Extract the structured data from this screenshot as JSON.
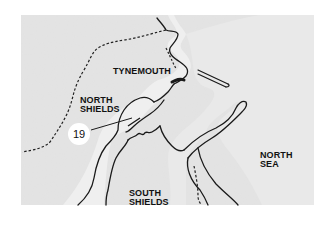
{
  "map": {
    "colors": {
      "land": "#e6e6e6",
      "water": "#f3f3f3",
      "coastline": "#1a1a1a",
      "background": "#ffffff"
    },
    "labels": {
      "tynemouth": "TYNEMOUTH",
      "north_shields": "NORTH\nSHIELDS",
      "south_shields": "SOUTH\nSHIELDS",
      "north_sea": "NORTH\nSEA"
    },
    "callout": {
      "number": "19"
    }
  }
}
